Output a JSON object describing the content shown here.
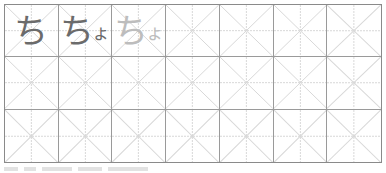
{
  "worksheet": {
    "grid": {
      "columns": 7,
      "rows": 3,
      "line_color": "#9a9a9a",
      "guide_color": "#d8d8d8"
    },
    "cells": [
      {
        "row": 0,
        "col": 0,
        "main": "ち",
        "small": "",
        "color": "#6b6b6b"
      },
      {
        "row": 0,
        "col": 1,
        "main": "ち",
        "small": "ょ",
        "color": "#6b6b6b"
      },
      {
        "row": 0,
        "col": 2,
        "main": "ち",
        "small": "ょ",
        "color": "#bdbdbd"
      }
    ]
  },
  "footer": {
    "text": ""
  }
}
